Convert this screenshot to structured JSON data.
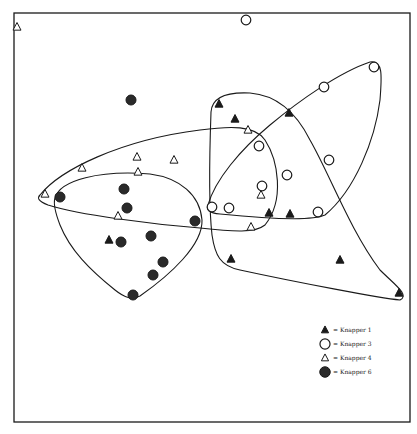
{
  "chart_data": {
    "type": "scatter",
    "title": "",
    "xlabel": "",
    "ylabel": "",
    "grid": false,
    "axes_ticks": false,
    "frame": {
      "x0": 14,
      "y0": 13,
      "x1": 410,
      "y1": 422
    },
    "legend_position": "lower-right",
    "series": [
      {
        "name": "Knapper 1",
        "marker": "filled-triangle",
        "points": [
          [
            219,
            104
          ],
          [
            235,
            119
          ],
          [
            289,
            113
          ],
          [
            269,
            213
          ],
          [
            290,
            214
          ],
          [
            109,
            240
          ],
          [
            231,
            259
          ],
          [
            340,
            260
          ],
          [
            399,
            293
          ]
        ]
      },
      {
        "name": "Knapper 3",
        "marker": "open-circle",
        "points": [
          [
            246,
            20
          ],
          [
            374,
            67
          ],
          [
            324,
            87
          ],
          [
            259,
            146
          ],
          [
            329,
            160
          ],
          [
            287,
            175
          ],
          [
            262,
            186
          ],
          [
            212,
            207
          ],
          [
            229,
            208
          ],
          [
            318,
            212
          ]
        ]
      },
      {
        "name": "Knapper 4",
        "marker": "open-triangle",
        "points": [
          [
            17,
            27
          ],
          [
            82,
            168
          ],
          [
            137,
            157
          ],
          [
            138,
            172
          ],
          [
            174,
            160
          ],
          [
            45,
            194
          ],
          [
            118,
            216
          ],
          [
            248,
            130
          ],
          [
            261,
            195
          ],
          [
            251,
            227
          ]
        ]
      },
      {
        "name": "Knapper 6",
        "marker": "filled-circle",
        "points": [
          [
            131,
            100
          ],
          [
            60,
            197
          ],
          [
            124,
            189
          ],
          [
            127,
            208
          ],
          [
            195,
            221
          ],
          [
            121,
            242
          ],
          [
            151,
            236
          ],
          [
            163,
            262
          ],
          [
            153,
            275
          ],
          [
            133,
            295
          ]
        ]
      }
    ],
    "hulls": [
      {
        "series": "Knapper 1",
        "path": "M211,112 C212,96 230,92 250,93 C275,95 295,110 310,140 C330,175 350,230 380,270 C395,285 410,295 400,300 C380,298 300,283 240,270 C220,266 215,255 212,235 C208,200 210,140 211,112 Z"
      },
      {
        "series": "Knapper 3",
        "path": "M208,205 C215,180 240,150 270,125 C300,100 340,72 370,62 C383,60 382,75 380,100 C375,140 355,190 325,215 C310,222 260,218 220,214 C209,213 206,210 208,205 Z"
      },
      {
        "series": "Knapper 4",
        "path": "M40,195 C60,170 120,140 200,130 C230,126 255,125 265,140 C278,160 285,200 265,225 C255,233 235,232 200,228 C150,224 80,215 48,205 C38,201 37,198 40,195 Z"
      },
      {
        "series": "Knapper 6",
        "path": "M55,198 C60,180 100,170 150,174 C180,178 200,195 202,220 C203,245 170,275 140,296 C132,300 125,298 115,290 C90,270 70,250 60,225 C55,212 53,204 55,198 Z"
      }
    ]
  },
  "legend": {
    "items": [
      {
        "marker": "filled-triangle",
        "label": "= Knapper 1"
      },
      {
        "marker": "open-circle",
        "label": "= Knapper 3"
      },
      {
        "marker": "open-triangle",
        "label": "= Knapper 4"
      },
      {
        "marker": "filled-circle",
        "label": "= Knapper 6"
      }
    ]
  },
  "colors": {
    "ink": "#1a1a1a",
    "paper": "#ffffff",
    "dot_fill": "#2a2a2a"
  }
}
